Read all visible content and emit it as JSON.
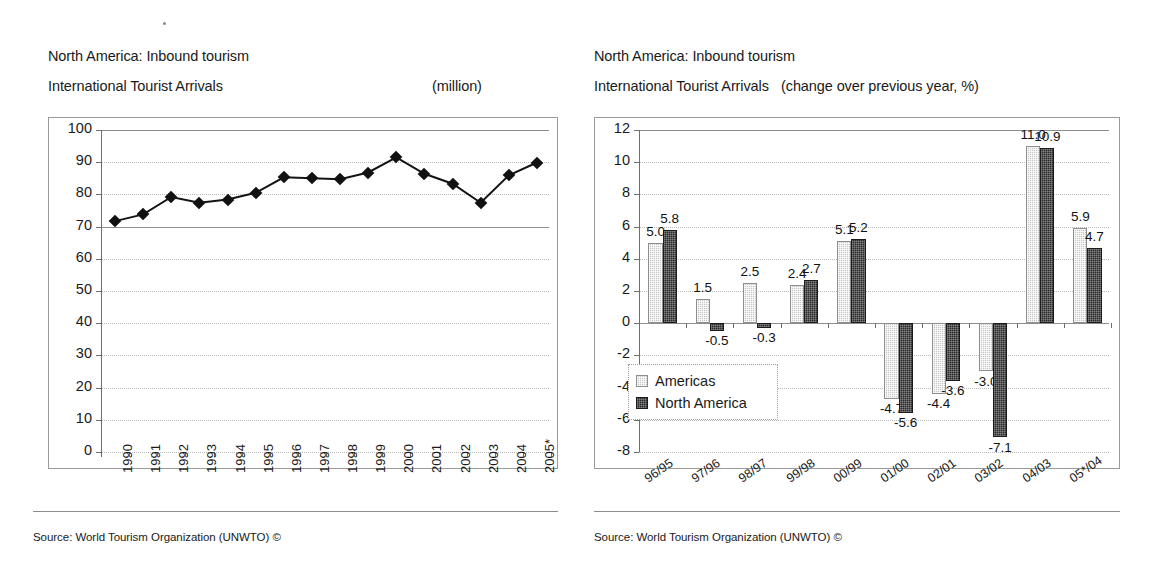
{
  "left_panel": {
    "title_line1": "North America: Inbound tourism",
    "title_line2": "International Tourist Arrivals",
    "unit": "(million)",
    "source": "Source: World Tourism Organization (UNWTO) ©"
  },
  "right_panel": {
    "title_line1": "North America: Inbound tourism",
    "title_line2": "International Tourist Arrivals",
    "unit": "(change over previous year, %)",
    "source": "Source: World Tourism Organization (UNWTO) ©"
  },
  "chart_data": [
    {
      "type": "line",
      "title": "North America: Inbound tourism — International Tourist Arrivals",
      "subtitle": "(million)",
      "xlabel": "",
      "ylabel": "",
      "ylim": [
        0,
        100
      ],
      "ytick_step": 10,
      "yticks": [
        0,
        10,
        20,
        30,
        40,
        50,
        60,
        70,
        80,
        90,
        100
      ],
      "grid": true,
      "legend": "none",
      "categories": [
        "1990",
        "1991",
        "1992",
        "1993",
        "1994",
        "1995",
        "1996",
        "1997",
        "1998",
        "1999",
        "2000",
        "2001",
        "2002",
        "2003",
        "2004",
        "2005*"
      ],
      "series": [
        {
          "name": "International Tourist Arrivals",
          "marker": "diamond",
          "values": [
            71.7,
            73.8,
            79.2,
            77.4,
            78.4,
            80.5,
            85.3,
            85.0,
            84.7,
            86.8,
            91.5,
            86.4,
            83.3,
            77.4,
            85.9,
            89.9
          ]
        }
      ]
    },
    {
      "type": "bar",
      "title": "North America: Inbound tourism — International Tourist Arrivals",
      "subtitle": "(change over previous year, %)",
      "xlabel": "",
      "ylabel": "",
      "ylim": [
        -8,
        12
      ],
      "ytick_step": 2,
      "yticks": [
        -8,
        -6,
        -4,
        -2,
        0,
        2,
        4,
        6,
        8,
        10,
        12
      ],
      "grid": true,
      "legend": "inside-left",
      "categories": [
        "96/95",
        "97/96",
        "98/97",
        "99/98",
        "00/99",
        "01/00",
        "02/01",
        "03/02",
        "04/03",
        "05*/04"
      ],
      "series": [
        {
          "name": "Americas",
          "values": [
            5.0,
            1.5,
            2.5,
            2.4,
            5.1,
            -4.7,
            -4.4,
            -3.0,
            11.0,
            5.9
          ]
        },
        {
          "name": "North America",
          "values": [
            5.8,
            -0.5,
            -0.3,
            2.7,
            5.2,
            -5.6,
            -3.6,
            -7.1,
            10.9,
            4.7
          ]
        }
      ],
      "data_labels": {
        "Americas": [
          "5.0",
          "1.5",
          "2.5",
          "2.4",
          "5.1",
          "-4.7",
          "-4.4",
          "-3.0",
          "11.0",
          "5.9"
        ],
        "North America": [
          "5.8",
          "-0.5",
          "-0.3",
          "2.7",
          "5.2",
          "-5.6",
          "-3.6",
          "-7.1",
          "10.9",
          "4.7"
        ]
      }
    }
  ]
}
